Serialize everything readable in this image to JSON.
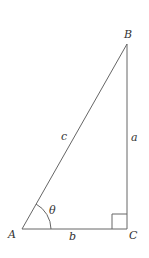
{
  "diagram": {
    "type": "right-triangle",
    "vertices": {
      "A": "A",
      "B": "B",
      "C": "C"
    },
    "sides": {
      "hypotenuse": "c",
      "opposite": "a",
      "adjacent": "b"
    },
    "angle": "θ",
    "colors": {
      "line": "#555555",
      "text": "#333333"
    }
  }
}
